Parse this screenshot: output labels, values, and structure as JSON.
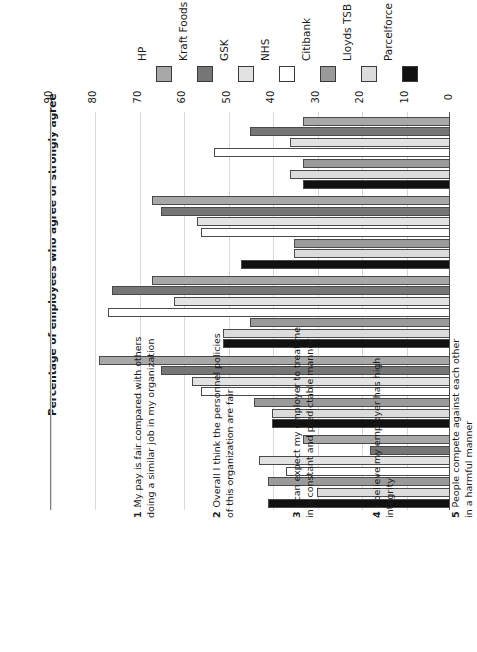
{
  "chart_data": {
    "type": "bar",
    "orientation": "rotated-90ccw",
    "title": "",
    "xlabel": "",
    "ylabel": "Percentage of employees who agree or strongly agree",
    "ylim": [
      0,
      90
    ],
    "ytick_step": 10,
    "yticks": [
      "0",
      "10",
      "20",
      "30",
      "40",
      "50",
      "60",
      "70",
      "80",
      "90"
    ],
    "grid": true,
    "legend_position": "top",
    "categories": [
      "My pay is fair compared with others doing a similar job in my organization",
      "Overall I think the personnel policies of this organization are fair",
      "I can expect my employer to treat me in a constant and predictable manner",
      "I believe my employer has high integrity",
      "People compete against each other in a harmful manner"
    ],
    "category_numbers": [
      "1",
      "2",
      "3",
      "4",
      "5"
    ],
    "category_lines": [
      [
        "My pay is fair compared with others",
        "doing a similar job in my organization"
      ],
      [
        "Overall I think the personnel policies",
        "of this organization are fair"
      ],
      [
        "I can expect my employer to treat me",
        "in a constant and predictable manner"
      ],
      [
        "I believe my employer has high",
        "integrity"
      ],
      [
        "People compete against each other",
        "in a harmful manner"
      ]
    ],
    "series": [
      {
        "name": "HP",
        "color": "#a8a8a8",
        "values": [
          33,
          67,
          67,
          79,
          33
        ]
      },
      {
        "name": "Kraft Foods",
        "color": "#767676",
        "values": [
          45,
          65,
          76,
          65,
          18
        ]
      },
      {
        "name": "GSK",
        "color": "#e2e2e2",
        "values": [
          36,
          57,
          62,
          58,
          43
        ]
      },
      {
        "name": "NHS",
        "color": "#ffffff",
        "values": [
          53,
          56,
          77,
          56,
          37
        ]
      },
      {
        "name": "Citibank",
        "color": "#9a9a9a",
        "values": [
          33,
          35,
          45,
          44,
          41
        ]
      },
      {
        "name": "Lloyds TSB",
        "color": "#dcdcdc",
        "values": [
          36,
          35,
          51,
          40,
          30
        ]
      },
      {
        "name": "Parcelforce",
        "color": "#111111",
        "values": [
          33,
          47,
          51,
          40,
          41
        ]
      }
    ]
  }
}
